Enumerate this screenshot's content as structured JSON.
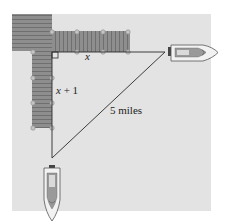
{
  "diagram": {
    "type": "right-triangle word problem illustration",
    "labels": {
      "horizontal_leg": "x",
      "vertical_leg_var": "x",
      "vertical_leg_rest": " + 1",
      "hypotenuse": "5 miles"
    },
    "objects": {
      "dock": "wooden dock with two perpendicular piers",
      "boat_east": "speedboat heading east",
      "boat_south": "speedboat heading south",
      "right_angle_marker": "square right-angle marker at dock corner"
    },
    "colors": {
      "water": "#e3e3e3",
      "dock": "#8e8e8e",
      "plank_line": "#6f6f6f",
      "post": "#bdbdbd",
      "line": "#2a2a2a",
      "boat_hull": "#f2f2f2",
      "boat_detail": "#7a7a7a"
    }
  }
}
